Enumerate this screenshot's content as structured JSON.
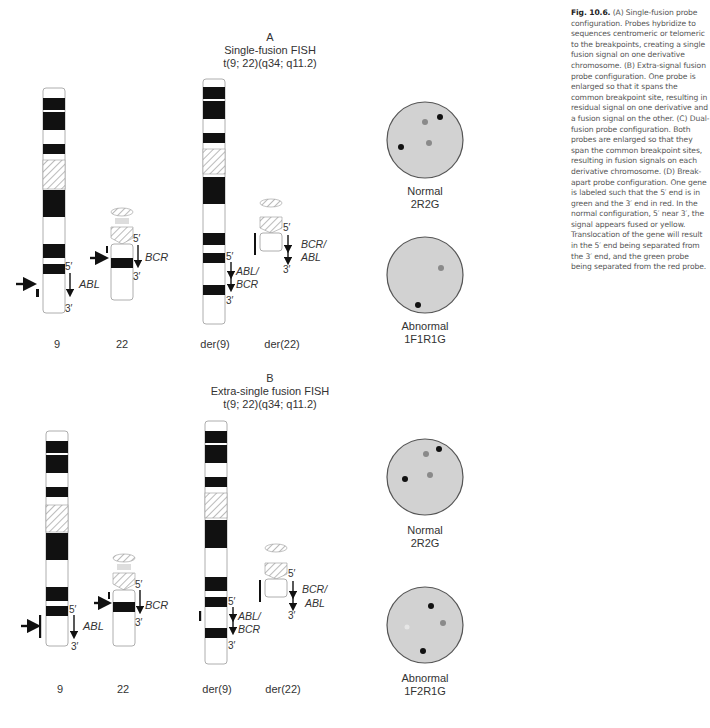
{
  "caption": {
    "fig_label": "Fig. 10.6.",
    "text": "(A) Single-fusion probe configuration. Probes hybridize to sequences centromeric or telomeric to the breakpoints, creating a single fusion signal on one derivative chromosome. (B) Extra-signal fusion probe configuration. One probe is enlarged so that it spans the common breakpoint site, resulting in residual signal on one derivative and a fusion signal on the other. (C) Dual-fusion probe configuration. Both probes are enlarged so that they span the common breakpoint sites, resulting in fusion signals on each derivative chromosome. (D) Break-apart probe configuration. One gene is labeled such that the 5′ end is in green and the 3′ end in red. In the normal configuration, 5′ near 3′, the signal appears fused or yellow. Translocation of the gene will result in the 5′ end being separated from the 3′ end, and the green probe being separated from the red probe."
  },
  "panels": [
    {
      "letter": "A",
      "title": "Single-fusion FISH",
      "karyotype": "t(9; 22)(q34; q11.2)",
      "chromosomes": [
        "9",
        "22",
        "der(9)",
        "der(22)"
      ],
      "gene_labels": {
        "chr9": "ABL",
        "chr22": "BCR",
        "der9_a": "ABL/",
        "der9_b": "BCR",
        "der22_a": "BCR/",
        "der22_b": "ABL"
      },
      "ends": {
        "five": "5′",
        "three": "3′"
      },
      "nuclei": [
        {
          "label": "Normal",
          "code": "2R2G"
        },
        {
          "label": "Abnormal",
          "code": "1F1R1G"
        }
      ]
    },
    {
      "letter": "B",
      "title": "Extra-single fusion FISH",
      "karyotype": "t(9; 22)(q34; q11.2)",
      "chromosomes": [
        "9",
        "22",
        "der(9)",
        "der(22)"
      ],
      "gene_labels": {
        "chr9": "ABL",
        "chr22": "BCR",
        "der9_a": "ABL/",
        "der9_b": "BCR",
        "der22_a": "BCR/",
        "der22_b": "ABL"
      },
      "ends": {
        "five": "5′",
        "three": "3′"
      },
      "nuclei": [
        {
          "label": "Normal",
          "code": "2R2G"
        },
        {
          "label": "Abnormal",
          "code": "1F2R1G"
        }
      ]
    }
  ],
  "colors": {
    "band": "#111111",
    "nucleus": "#d2d2d2",
    "nucleus_border": "#555555",
    "signal_dark": "#111111",
    "signal_gray": "#8a8a8a",
    "hatch": "#aaaaaa"
  }
}
